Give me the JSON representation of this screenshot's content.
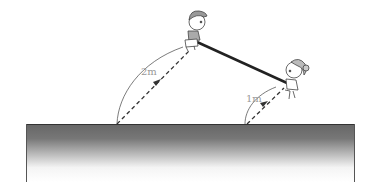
{
  "diagram": {
    "labels": {
      "left_distance": "2m",
      "right_distance": "1m"
    },
    "figures": {
      "left": "boy",
      "right": "girl"
    },
    "colors": {
      "plank": "#222222",
      "ground_top": "#666666",
      "ground_bottom": "#ffffff",
      "label": "#999999",
      "line": "#333333"
    }
  }
}
